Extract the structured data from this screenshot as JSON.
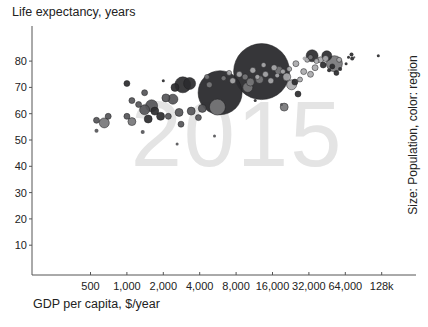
{
  "chart_data": {
    "type": "scatter",
    "subtype": "bubble",
    "title": "Life expectancy, years",
    "ylabel": "Life expectancy, years",
    "xlabel": "GDP per capita, $/year",
    "side_label": "Size: Population, color: region",
    "watermark": "2015",
    "xscale": "log2",
    "xlim": [
      200,
      200000
    ],
    "ylim": [
      0,
      90
    ],
    "grid": false,
    "x_ticks": [
      {
        "value": 500,
        "label": "500"
      },
      {
        "value": 1000,
        "label": "1,000"
      },
      {
        "value": 2000,
        "label": "2,000"
      },
      {
        "value": 4000,
        "label": "4,000"
      },
      {
        "value": 8000,
        "label": "8,000"
      },
      {
        "value": 16000,
        "label": "16,000"
      },
      {
        "value": 32000,
        "label": "32,000"
      },
      {
        "value": 64000,
        "label": "64,000"
      },
      {
        "value": 128000,
        "label": "128k"
      }
    ],
    "y_ticks": [
      {
        "value": 10,
        "label": "10"
      },
      {
        "value": 20,
        "label": "20"
      },
      {
        "value": 30,
        "label": "30"
      },
      {
        "value": 40,
        "label": "40"
      },
      {
        "value": 50,
        "label": "50"
      },
      {
        "value": 60,
        "label": "60"
      },
      {
        "value": 70,
        "label": "70"
      },
      {
        "value": 80,
        "label": "80"
      }
    ],
    "region_colors": {
      "dark": "#2b2b2e",
      "mid": "#555558",
      "gray": "#77777a",
      "light": "#a9a9ab"
    },
    "points": [
      {
        "gdp": 13000,
        "le": 76.0,
        "r": 28,
        "c": "dark"
      },
      {
        "gdp": 5900,
        "le": 68.0,
        "r": 22,
        "c": "dark"
      },
      {
        "gdp": 5600,
        "le": 62.5,
        "r": 8,
        "c": "gray"
      },
      {
        "gdp": 10500,
        "le": 72.0,
        "r": 4,
        "c": "gray"
      },
      {
        "gdp": 3300,
        "le": 71.5,
        "r": 6,
        "c": "dark"
      },
      {
        "gdp": 2900,
        "le": 71.0,
        "r": 8,
        "c": "dark"
      },
      {
        "gdp": 2500,
        "le": 70.0,
        "r": 4,
        "c": "dark"
      },
      {
        "gdp": 2100,
        "le": 66.0,
        "r": 4,
        "c": "mid"
      },
      {
        "gdp": 2400,
        "le": 65.5,
        "r": 5,
        "c": "mid"
      },
      {
        "gdp": 1600,
        "le": 63.0,
        "r": 6,
        "c": "mid"
      },
      {
        "gdp": 1400,
        "le": 61.5,
        "r": 5,
        "c": "mid"
      },
      {
        "gdp": 1250,
        "le": 63.5,
        "r": 3,
        "c": "mid"
      },
      {
        "gdp": 1700,
        "le": 61.0,
        "r": 4,
        "c": "dark"
      },
      {
        "gdp": 1900,
        "le": 59.0,
        "r": 4,
        "c": "dark"
      },
      {
        "gdp": 1500,
        "le": 58.0,
        "r": 4,
        "c": "dark"
      },
      {
        "gdp": 2200,
        "le": 59.0,
        "r": 3,
        "c": "mid"
      },
      {
        "gdp": 2700,
        "le": 60.5,
        "r": 4,
        "c": "mid"
      },
      {
        "gdp": 3400,
        "le": 61.0,
        "r": 4,
        "c": "mid"
      },
      {
        "gdp": 4200,
        "le": 62.0,
        "r": 4,
        "c": "mid"
      },
      {
        "gdp": 3900,
        "le": 58.5,
        "r": 3,
        "c": "mid"
      },
      {
        "gdp": 2800,
        "le": 56.0,
        "r": 3,
        "c": "mid"
      },
      {
        "gdp": 1000,
        "le": 59.0,
        "r": 3,
        "c": "mid"
      },
      {
        "gdp": 1100,
        "le": 57.0,
        "r": 4,
        "c": "gray"
      },
      {
        "gdp": 700,
        "le": 59.0,
        "r": 3,
        "c": "mid"
      },
      {
        "gdp": 650,
        "le": 56.5,
        "r": 5,
        "c": "gray"
      },
      {
        "gdp": 560,
        "le": 57.5,
        "r": 3,
        "c": "mid"
      },
      {
        "gdp": 560,
        "le": 53.5,
        "r": 2,
        "c": "mid"
      },
      {
        "gdp": 1350,
        "le": 53.0,
        "r": 2,
        "c": "mid"
      },
      {
        "gdp": 1000,
        "le": 71.5,
        "r": 3,
        "c": "dark"
      },
      {
        "gdp": 1400,
        "le": 68.0,
        "r": 3,
        "c": "mid"
      },
      {
        "gdp": 1100,
        "le": 65.0,
        "r": 3,
        "c": "mid"
      },
      {
        "gdp": 2000,
        "le": 72.5,
        "r": 1.5,
        "c": "dark"
      },
      {
        "gdp": 2600,
        "le": 48.5,
        "r": 1.5,
        "c": "mid"
      },
      {
        "gdp": 5300,
        "le": 51.5,
        "r": 1.5,
        "c": "mid"
      },
      {
        "gdp": 25000,
        "le": 79.0,
        "r": 3,
        "c": "light"
      },
      {
        "gdp": 21000,
        "le": 74.0,
        "r": 4,
        "c": "light"
      },
      {
        "gdp": 18000,
        "le": 76.5,
        "r": 4,
        "c": "gray"
      },
      {
        "gdp": 15500,
        "le": 72.5,
        "r": 3,
        "c": "light"
      },
      {
        "gdp": 23000,
        "le": 71.0,
        "r": 5,
        "c": "light"
      },
      {
        "gdp": 24500,
        "le": 72.0,
        "r": 3,
        "c": "dark"
      },
      {
        "gdp": 26000,
        "le": 67.5,
        "r": 3,
        "c": "dark"
      },
      {
        "gdp": 20000,
        "le": 62.5,
        "r": 4,
        "c": "gray"
      },
      {
        "gdp": 11500,
        "le": 65.0,
        "r": 1.5,
        "c": "dark"
      },
      {
        "gdp": 19000,
        "le": 63.5,
        "r": 1.5,
        "c": "mid"
      },
      {
        "gdp": 33000,
        "le": 75.0,
        "r": 3,
        "c": "light"
      },
      {
        "gdp": 29000,
        "le": 76.0,
        "r": 3,
        "c": "light"
      },
      {
        "gdp": 36000,
        "le": 77.5,
        "r": 3,
        "c": "light"
      },
      {
        "gdp": 40000,
        "le": 80.5,
        "r": 3,
        "c": "light"
      },
      {
        "gdp": 44000,
        "le": 81.0,
        "r": 3,
        "c": "light"
      },
      {
        "gdp": 45000,
        "le": 82.0,
        "r": 5,
        "c": "dark"
      },
      {
        "gdp": 42000,
        "le": 78.5,
        "r": 3,
        "c": "dark"
      },
      {
        "gdp": 52000,
        "le": 79.0,
        "r": 8,
        "c": "gray"
      },
      {
        "gdp": 50000,
        "le": 78.0,
        "r": 2.5,
        "c": "dark"
      },
      {
        "gdp": 54000,
        "le": 75.5,
        "r": 2.5,
        "c": "dark"
      },
      {
        "gdp": 47000,
        "le": 76.5,
        "r": 2,
        "c": "dark"
      },
      {
        "gdp": 57000,
        "le": 80.5,
        "r": 2.5,
        "c": "light"
      },
      {
        "gdp": 58000,
        "le": 77.0,
        "r": 2,
        "c": "dark"
      },
      {
        "gdp": 37000,
        "le": 80.0,
        "r": 2.5,
        "c": "light"
      },
      {
        "gdp": 31000,
        "le": 80.5,
        "r": 2.5,
        "c": "light"
      },
      {
        "gdp": 68000,
        "le": 81.5,
        "r": 1.5,
        "c": "dark"
      },
      {
        "gdp": 72000,
        "le": 82.5,
        "r": 2,
        "c": "dark"
      },
      {
        "gdp": 73000,
        "le": 81.0,
        "r": 2,
        "c": "dark"
      },
      {
        "gdp": 76000,
        "le": 81.5,
        "r": 1,
        "c": "mid"
      },
      {
        "gdp": 65000,
        "le": 79.0,
        "r": 1.5,
        "c": "dark"
      },
      {
        "gdp": 120000,
        "le": 82.0,
        "r": 1.5,
        "c": "dark"
      },
      {
        "gdp": 8500,
        "le": 75.0,
        "r": 3,
        "c": "light"
      },
      {
        "gdp": 9500,
        "le": 74.0,
        "r": 3,
        "c": "gray"
      },
      {
        "gdp": 7500,
        "le": 72.5,
        "r": 3,
        "c": "light"
      },
      {
        "gdp": 11000,
        "le": 76.5,
        "r": 3,
        "c": "light"
      },
      {
        "gdp": 12000,
        "le": 74.0,
        "r": 2.5,
        "c": "light"
      },
      {
        "gdp": 14000,
        "le": 75.0,
        "r": 3,
        "c": "light"
      },
      {
        "gdp": 16500,
        "le": 77.5,
        "r": 3,
        "c": "light"
      },
      {
        "gdp": 13500,
        "le": 78.5,
        "r": 2.5,
        "c": "light"
      },
      {
        "gdp": 12500,
        "le": 73.0,
        "r": 4,
        "c": "gray"
      },
      {
        "gdp": 10000,
        "le": 70.0,
        "r": 5,
        "c": "gray"
      },
      {
        "gdp": 7000,
        "le": 75.5,
        "r": 2.5,
        "c": "light"
      },
      {
        "gdp": 6300,
        "le": 73.5,
        "r": 2.5,
        "c": "gray"
      },
      {
        "gdp": 4800,
        "le": 71.0,
        "r": 3,
        "c": "gray"
      },
      {
        "gdp": 4600,
        "le": 74.0,
        "r": 2.5,
        "c": "gray"
      },
      {
        "gdp": 17500,
        "le": 74.5,
        "r": 2,
        "c": "light"
      },
      {
        "gdp": 19500,
        "le": 76.0,
        "r": 2.5,
        "c": "light"
      },
      {
        "gdp": 22000,
        "le": 77.0,
        "r": 2.5,
        "c": "light"
      },
      {
        "gdp": 27000,
        "le": 73.0,
        "r": 2.5,
        "c": "light"
      },
      {
        "gdp": 29500,
        "le": 81.0,
        "r": 2,
        "c": "light"
      },
      {
        "gdp": 34000,
        "le": 82.0,
        "r": 6,
        "c": "dark"
      },
      {
        "gdp": 33000,
        "le": 81.5,
        "r": 2.5,
        "c": "gray"
      }
    ]
  }
}
